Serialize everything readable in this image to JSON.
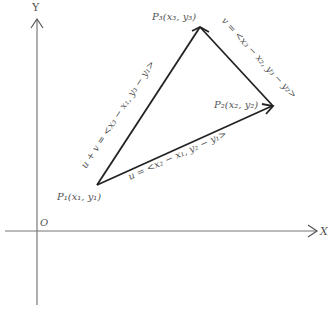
{
  "diagram": {
    "axes": {
      "x_label": "X",
      "y_label": "Y",
      "origin_label": "O"
    },
    "points": {
      "p1": {
        "name": "P",
        "sub": "1",
        "coords": "(x₁, y₁)",
        "label": "P₁(x₁, y₁)"
      },
      "p2": {
        "name": "P",
        "sub": "2",
        "coords": "(x₂, y₂)",
        "label": "P₂(x₂, y₂)"
      },
      "p3": {
        "name": "P",
        "sub": "3",
        "coords": "(x₃, y₃)",
        "label": "P₃(x₃, y₃)"
      }
    },
    "vectors": {
      "u": {
        "name": "u",
        "label": "u = <x₂ − x₁, y₂ − y₁>"
      },
      "v": {
        "name": "v",
        "label": "v = <x₃ − x₂, y₃ − y₂>"
      },
      "u_plus_v": {
        "name": "u + v",
        "label": "u + v = <x₃ − x₁, y₃ − y₁>"
      }
    },
    "colors": {
      "axis": "#666666",
      "vector": "#222222",
      "text": "#555555"
    }
  }
}
